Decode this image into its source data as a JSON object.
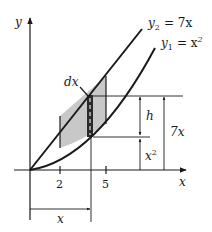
{
  "diagram": {
    "type": "area-between-curves",
    "axes": {
      "x_label": "x",
      "y_label": "y"
    },
    "curves": [
      {
        "id": "y2",
        "label_var": "y",
        "label_sub": "2",
        "label_rhs": "= 7x",
        "equation": "y2 = 7x"
      },
      {
        "id": "y1",
        "label_var": "y",
        "label_sub": "1",
        "label_rhs": "= x",
        "label_exp": "2",
        "equation": "y1 = x^2"
      }
    ],
    "ticks": [
      {
        "value": "2"
      },
      {
        "value": "5"
      }
    ],
    "strip_label": "dx",
    "dimensions": {
      "height": "h",
      "lower": "x",
      "lower_exp": "2",
      "upper": "7x",
      "horizontal": "x"
    },
    "colors": {
      "line": "#1a1a1a",
      "shade": "#c8c8c8",
      "strip": "#2a2a2a"
    }
  }
}
